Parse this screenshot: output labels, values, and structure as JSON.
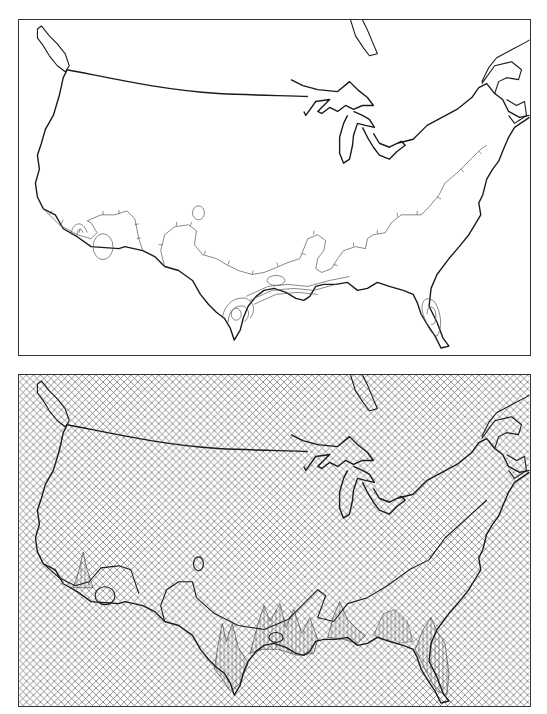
{
  "figure": {
    "panels": [
      {
        "id": "top",
        "description": "Contour map of the conterminous United States with hachured contour lines concentrated along southern border and Gulf coast",
        "style": "line contours, white background",
        "colors": {
          "line": "#1a1a1a",
          "contour": "#555555",
          "background": "#ffffff"
        }
      },
      {
        "id": "bottom",
        "description": "Perspective surface (fishnet) rendering of the same field over the United States with peaks along the Gulf coast, Texas, Florida and southwest",
        "style": "crosshatch mesh",
        "colors": {
          "line": "#1a1a1a",
          "mesh": "#666666",
          "background": "#ffffff"
        }
      }
    ]
  }
}
